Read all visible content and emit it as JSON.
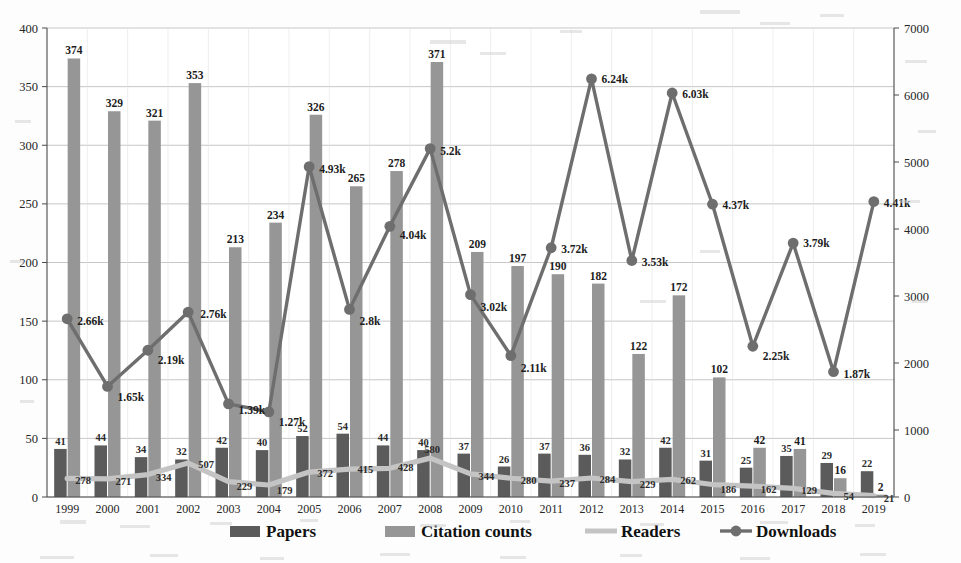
{
  "chart_data": {
    "type": "bar",
    "title": "",
    "subtitle": "",
    "xlabel": "",
    "ylabel": "",
    "grid": true,
    "legend_position": "bottom",
    "categories": [
      "1999",
      "2000",
      "2001",
      "2002",
      "2003",
      "2004",
      "2005",
      "2006",
      "2007",
      "2008",
      "2009",
      "2010",
      "2011",
      "2012",
      "2013",
      "2014",
      "2015",
      "2016",
      "2017",
      "2018",
      "2019"
    ],
    "left_axis": {
      "label": "",
      "ylim": [
        0,
        400
      ],
      "ticks": [
        0,
        50,
        100,
        150,
        200,
        250,
        300,
        350,
        400
      ],
      "tick_labels": [
        "0",
        "50",
        "100",
        "150",
        "200",
        "250",
        "300",
        "350",
        "400"
      ]
    },
    "right_axis": {
      "label": "",
      "ylim": [
        0,
        7000
      ],
      "ticks": [
        0,
        1000,
        2000,
        3000,
        4000,
        5000,
        6000,
        7000
      ],
      "tick_labels": [
        "0",
        "1000",
        "2000",
        "3000",
        "4000",
        "5000",
        "6000",
        "7000"
      ]
    },
    "series": [
      {
        "name": "Papers",
        "type": "bar",
        "axis": "left",
        "color": "#5b5b5b",
        "values": [
          41,
          44,
          34,
          32,
          42,
          40,
          52,
          54,
          44,
          40,
          37,
          26,
          37,
          36,
          32,
          42,
          31,
          25,
          35,
          29,
          22
        ],
        "labels": [
          "41",
          "44",
          "34",
          "32",
          "42",
          "40",
          "52",
          "54",
          "44",
          "40",
          "37",
          "26",
          "37",
          "36",
          "32",
          "42",
          "31",
          "25",
          "35",
          "29",
          "22"
        ]
      },
      {
        "name": "Citation counts",
        "type": "bar",
        "axis": "left",
        "color": "#969696",
        "values": [
          374,
          329,
          321,
          353,
          213,
          234,
          326,
          265,
          278,
          371,
          209,
          197,
          190,
          182,
          122,
          172,
          102,
          42,
          41,
          16,
          2
        ],
        "labels": [
          "374",
          "329",
          "321",
          "353",
          "213",
          "234",
          "326",
          "265",
          "278",
          "371",
          "209",
          "197",
          "190",
          "182",
          "122",
          "172",
          "102",
          "42",
          "41",
          "16",
          "2"
        ]
      },
      {
        "name": "Readers",
        "type": "line",
        "axis": "right",
        "color": "#c4c4c4",
        "values": [
          278,
          271,
          334,
          507,
          229,
          179,
          372,
          415,
          428,
          580,
          344,
          280,
          237,
          284,
          229,
          262,
          186,
          162,
          129,
          54,
          21
        ],
        "labels": [
          "278",
          "271",
          "334",
          "507",
          "229",
          "179",
          "372",
          "415",
          "428",
          "580",
          "344",
          "280",
          "237",
          "284",
          "229",
          "262",
          "186",
          "162",
          "129",
          "54",
          "21"
        ]
      },
      {
        "name": "Downloads",
        "type": "line",
        "axis": "right",
        "color": "#6e6e6e",
        "values": [
          2660,
          1650,
          2190,
          2760,
          1390,
          1270,
          4930,
          2800,
          4040,
          5200,
          3020,
          2110,
          3720,
          6240,
          3530,
          6030,
          4370,
          2250,
          3790,
          1870,
          4410
        ],
        "labels": [
          "2.66k",
          "1.65k",
          "2.19k",
          "2.76k",
          "1.39k",
          "1.27k",
          "4.93k",
          "2.8k",
          "4.04k",
          "5.2k",
          "3.02k",
          "2.11k",
          "3.72k",
          "6.24k",
          "3.53k",
          "6.03k",
          "4.37k",
          "2.25k",
          "3.79k",
          "1.87k",
          "4.41k"
        ]
      }
    ]
  },
  "legend": {
    "items": [
      {
        "label": "Papers",
        "marker": "bar-dark",
        "color": "#5b5b5b"
      },
      {
        "label": "Citation counts",
        "marker": "bar-light",
        "color": "#969696"
      },
      {
        "label": "Readers",
        "marker": "line-light",
        "color": "#c4c4c4"
      },
      {
        "label": "Downloads",
        "marker": "line-marker-dark",
        "color": "#6e6e6e"
      }
    ]
  }
}
